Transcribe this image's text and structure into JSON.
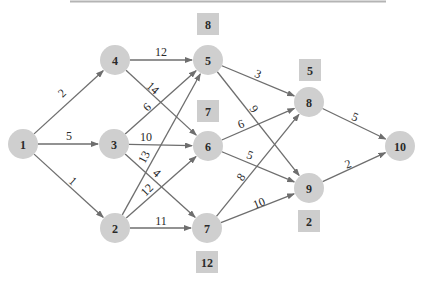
{
  "diagram": {
    "type": "directed-network",
    "nodes": [
      {
        "id": "1",
        "label": "1",
        "x": 23,
        "y": 144
      },
      {
        "id": "2",
        "label": "2",
        "x": 115,
        "y": 228
      },
      {
        "id": "3",
        "label": "3",
        "x": 114,
        "y": 144
      },
      {
        "id": "4",
        "label": "4",
        "x": 115,
        "y": 60
      },
      {
        "id": "5",
        "label": "5",
        "x": 208,
        "y": 60
      },
      {
        "id": "6",
        "label": "6",
        "x": 208,
        "y": 146
      },
      {
        "id": "7",
        "label": "7",
        "x": 207,
        "y": 228
      },
      {
        "id": "8",
        "label": "8",
        "x": 309,
        "y": 102
      },
      {
        "id": "9",
        "label": "9",
        "x": 309,
        "y": 188
      },
      {
        "id": "10",
        "label": "10",
        "x": 400,
        "y": 146
      }
    ],
    "edges": [
      {
        "from": "1",
        "to": "4",
        "weight": "2",
        "lx": 62,
        "ly": 93,
        "rot": -43
      },
      {
        "from": "1",
        "to": "3",
        "weight": "5",
        "lx": 69,
        "ly": 136,
        "rot": 0
      },
      {
        "from": "1",
        "to": "2",
        "weight": "1",
        "lx": 73,
        "ly": 181,
        "rot": 42
      },
      {
        "from": "4",
        "to": "5",
        "weight": "12",
        "lx": 161,
        "ly": 52,
        "rot": 0
      },
      {
        "from": "4",
        "to": "6",
        "weight": "14",
        "lx": 153,
        "ly": 88,
        "rot": 42
      },
      {
        "from": "3",
        "to": "5",
        "weight": "6",
        "lx": 147,
        "ly": 107,
        "rot": -43
      },
      {
        "from": "3",
        "to": "6",
        "weight": "10",
        "lx": 146,
        "ly": 137,
        "rot": 0
      },
      {
        "from": "3",
        "to": "7",
        "weight": "4",
        "lx": 157,
        "ly": 173,
        "rot": 42
      },
      {
        "from": "2",
        "to": "5",
        "weight": "13",
        "lx": 144,
        "ly": 157,
        "rot": -62
      },
      {
        "from": "2",
        "to": "6",
        "weight": "12",
        "lx": 147,
        "ly": 190,
        "rot": -45
      },
      {
        "from": "2",
        "to": "7",
        "weight": "11",
        "lx": 161,
        "ly": 221,
        "rot": 0
      },
      {
        "from": "5",
        "to": "8",
        "weight": "3",
        "lx": 258,
        "ly": 74,
        "rot": 22
      },
      {
        "from": "5",
        "to": "9",
        "weight": "9",
        "lx": 254,
        "ly": 109,
        "rot": 55
      },
      {
        "from": "6",
        "to": "8",
        "weight": "6",
        "lx": 241,
        "ly": 124,
        "rot": -20
      },
      {
        "from": "6",
        "to": "9",
        "weight": "5",
        "lx": 250,
        "ly": 155,
        "rot": 20
      },
      {
        "from": "7",
        "to": "8",
        "weight": "8",
        "lx": 241,
        "ly": 177,
        "rot": -55
      },
      {
        "from": "7",
        "to": "9",
        "weight": "10",
        "lx": 259,
        "ly": 203,
        "rot": -22
      },
      {
        "from": "8",
        "to": "10",
        "weight": "5",
        "lx": 355,
        "ly": 117,
        "rot": 22
      },
      {
        "from": "9",
        "to": "10",
        "weight": "2",
        "lx": 348,
        "ly": 164,
        "rot": -20
      }
    ],
    "boxes": [
      {
        "label": "8",
        "x": 208,
        "y": 24,
        "near": "5"
      },
      {
        "label": "7",
        "x": 208,
        "y": 111,
        "near": "6"
      },
      {
        "label": "12",
        "x": 207,
        "y": 262,
        "near": "7"
      },
      {
        "label": "5",
        "x": 310,
        "y": 70,
        "near": "8"
      },
      {
        "label": "2",
        "x": 309,
        "y": 221,
        "near": "9"
      }
    ],
    "colors": {
      "node_fill": "#cfcfcf",
      "box_fill": "#cdcdcd",
      "edge": "#6e6e6e",
      "text": "#2a2a2a",
      "top_rule": "#b4b4b4"
    }
  }
}
